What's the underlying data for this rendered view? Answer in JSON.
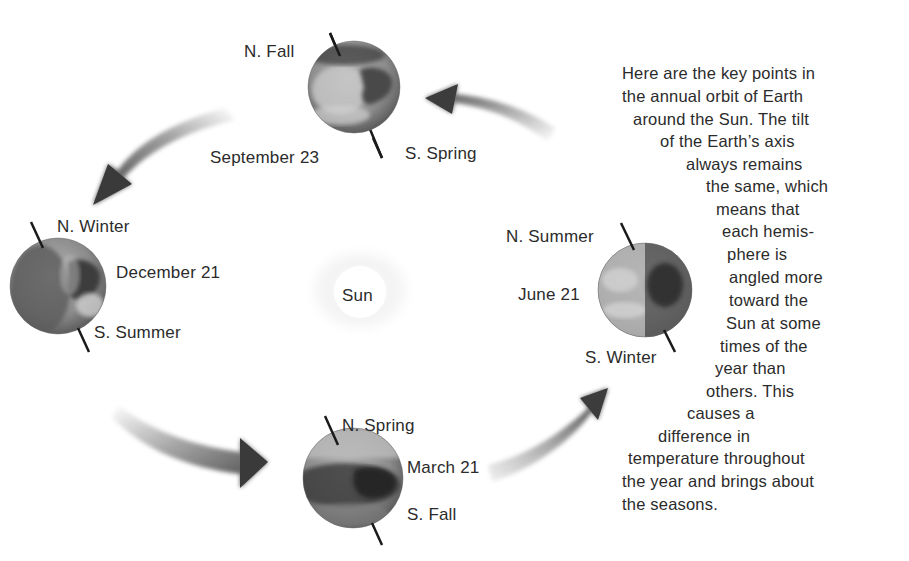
{
  "diagram": {
    "sun": {
      "label": "Sun"
    },
    "positions": [
      {
        "id": "september",
        "date": "September 23",
        "north": "N. Fall",
        "south": "S. Spring"
      },
      {
        "id": "december",
        "date": "December 21",
        "north": "N. Winter",
        "south": "S. Summer"
      },
      {
        "id": "march",
        "date": "March 21",
        "north": "N. Spring",
        "south": "S. Fall"
      },
      {
        "id": "june",
        "date": "June 21",
        "north": "N. Summer",
        "south": "S. Winter"
      }
    ],
    "orbit_direction": "counter-clockwise (June → September → December → March → June)",
    "caption_lines": [
      "Here are the key points in",
      "the annual orbit of Earth",
      "around the Sun. The tilt",
      "of the Earth’s axis",
      "always remains",
      "the same, which",
      "means that",
      "each hemis-",
      "phere is",
      "angled more",
      "toward the",
      "Sun at some",
      "times of the",
      "year than",
      "others. This",
      "causes a",
      "difference in",
      "temperature throughout",
      "the year and brings about",
      "the seasons."
    ],
    "colors": {
      "background": "#ffffff",
      "text": "#2b2b2b",
      "arrow_dark": "#3a3a3a",
      "arrow_light": "#e6e6e6",
      "axis": "#1a1a1a"
    }
  }
}
